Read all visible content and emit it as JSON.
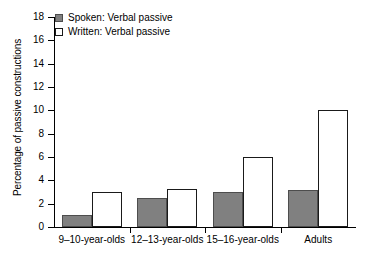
{
  "chart_data": {
    "type": "bar",
    "title": "",
    "subtitle": "",
    "xlabel": "",
    "ylabel": "Percentage of passive constructions",
    "categories": [
      "9–10-year-olds",
      "12–13-year-olds",
      "15–16-year-olds",
      "Adults"
    ],
    "series": [
      {
        "name": "Spoken: Verbal passive",
        "values": [
          1,
          2.5,
          3,
          3.2
        ],
        "color": "#808080",
        "fill": "solid"
      },
      {
        "name": "Written: Verbal passive",
        "values": [
          3,
          3.3,
          6,
          10
        ],
        "color": "#ffffff",
        "fill": "open"
      }
    ],
    "ylim": [
      0,
      18
    ],
    "ytick_step": 2,
    "yticks": [
      "0",
      "2",
      "4",
      "6",
      "8",
      "10",
      "12",
      "14",
      "16",
      "18"
    ],
    "grid": false,
    "legend_position": "top-left",
    "axis_color": "#000000"
  }
}
